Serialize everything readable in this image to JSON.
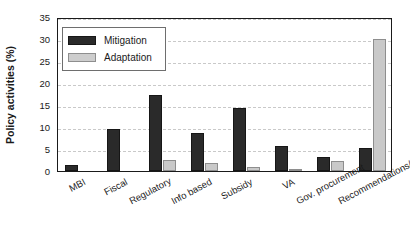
{
  "chart_data": {
    "type": "bar",
    "title": "",
    "xlabel": "",
    "ylabel": "Policy activities (%)",
    "ylim": [
      0,
      35
    ],
    "yticks": [
      0,
      5,
      10,
      15,
      20,
      25,
      30,
      35
    ],
    "grid": true,
    "legend_position": "top-left",
    "categories": [
      "MBI",
      "Fiscal",
      "Regulatory",
      "Info based",
      "Subsidy",
      "VA",
      "Gov. procurement",
      "Recommendations/other"
    ],
    "series": [
      {
        "name": "Mitigation",
        "color": "#2a2a2a",
        "values": [
          1.3,
          9.5,
          17.2,
          8.6,
          14.3,
          5.7,
          3.2,
          5.2
        ]
      },
      {
        "name": "Adaptation",
        "color": "#c9c9c9",
        "values": [
          0,
          0,
          2.4,
          1.8,
          0.9,
          0.3,
          2.3,
          29.9
        ]
      }
    ]
  },
  "legend": {
    "items": [
      {
        "label": "Mitigation",
        "swatch": "mitigation"
      },
      {
        "label": "Adaptation",
        "swatch": "adaptation"
      }
    ]
  }
}
